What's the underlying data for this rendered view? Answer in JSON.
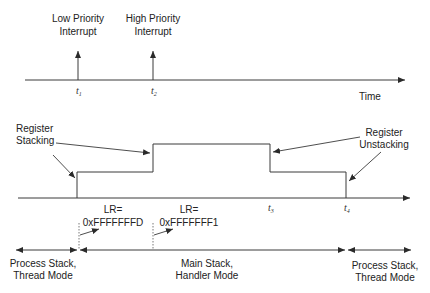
{
  "colors": {
    "line": "#3a3a3a",
    "text": "#222222",
    "background": "#ffffff"
  },
  "top_timeline": {
    "axis_label": "Time",
    "events": [
      {
        "label_line1": "Low Priority",
        "label_line2": "Interrupt",
        "tick": "t",
        "tick_sub": "1"
      },
      {
        "label_line1": "High Priority",
        "label_line2": "Interrupt",
        "tick": "t",
        "tick_sub": "2"
      }
    ]
  },
  "stack_waveform": {
    "annotations": {
      "stacking_line1": "Register",
      "stacking_line2": "Stacking",
      "unstacking_line1": "Register",
      "unstacking_line2": "Unstacking"
    },
    "ticks": [
      {
        "tick": "t",
        "tick_sub": "3"
      },
      {
        "tick": "t",
        "tick_sub": "4"
      }
    ]
  },
  "lr_values": [
    {
      "line1": "LR=",
      "line2": "0xFFFFFFFD"
    },
    {
      "line1": "LR=",
      "line2": "0xFFFFFFF1"
    }
  ],
  "modes": [
    {
      "line1": "Process Stack,",
      "line2": "Thread Mode"
    },
    {
      "line1": "Main Stack,",
      "line2": "Handler Mode"
    },
    {
      "line1": "Process Stack,",
      "line2": "Thread Mode"
    }
  ]
}
